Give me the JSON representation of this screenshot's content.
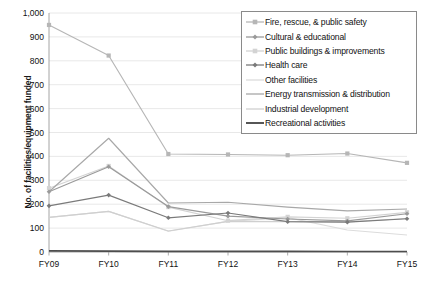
{
  "chart_data": {
    "type": "line",
    "title": "",
    "xlabel": "",
    "ylabel": "No. of facilities/equipment funded",
    "categories": [
      "FY09",
      "FY10",
      "FY11",
      "FY12",
      "FY13",
      "FY14",
      "FY15"
    ],
    "ylim": [
      0,
      1000
    ],
    "ytick_step": 100,
    "yticks": [
      "0",
      "100",
      "200",
      "300",
      "400",
      "500",
      "600",
      "700",
      "800",
      "900",
      "1,000"
    ],
    "grid": true,
    "legend_position": "top-right",
    "series": [
      {
        "name": "Fire, rescue, & public safety",
        "color": "#b6b6b6",
        "marker": "square",
        "values": [
          950,
          822,
          410,
          408,
          405,
          412,
          373
        ]
      },
      {
        "name": "Cultural & educational",
        "color": "#9a9a9a",
        "marker": "diamond",
        "values": [
          252,
          357,
          190,
          150,
          138,
          130,
          160
        ]
      },
      {
        "name": "Public buildings & improvements",
        "color": "#d3d3d3",
        "marker": "square",
        "values": [
          267,
          360,
          188,
          131,
          147,
          141,
          166
        ]
      },
      {
        "name": "Health care",
        "color": "#7a7a7a",
        "marker": "diamond",
        "values": [
          193,
          238,
          143,
          163,
          127,
          125,
          139
        ]
      },
      {
        "name": "Other facilities",
        "color": "#dcdcdc",
        "marker": "none",
        "values": [
          145,
          170,
          87,
          128,
          144,
          92,
          71
        ]
      },
      {
        "name": "Energy transmission & distribution",
        "color": "#a8a8a8",
        "marker": "none",
        "values": [
          252,
          476,
          205,
          208,
          188,
          172,
          180
        ]
      },
      {
        "name": "Industrial development",
        "color": "#cfcfcf",
        "marker": "none",
        "values": [
          145,
          170,
          88,
          128,
          127,
          126,
          140
        ]
      },
      {
        "name": "Recreational activities",
        "color": "#4d4d4d",
        "marker": "none",
        "values": [
          5,
          4,
          3,
          3,
          3,
          2,
          2
        ]
      }
    ]
  }
}
